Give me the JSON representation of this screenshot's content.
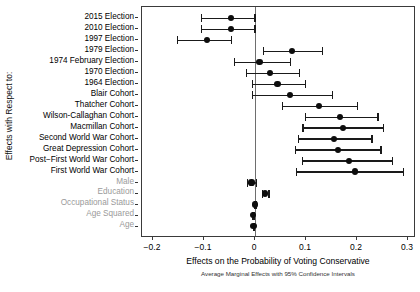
{
  "axis": {
    "y_title": "Effects with Respect to:",
    "x_title": "Effects on the Probability of Voting Conservative",
    "x_subtitle": "Average Marginal Effects with 95% Confidence Intervals"
  },
  "chart_data": {
    "type": "scatter",
    "subtype": "forest-plot",
    "title": "Effects on the Probability of Voting Conservative",
    "subtitle": "Average Marginal Effects with 95% Confidence Intervals",
    "xlabel": "Effects on the Probability of Voting Conservative",
    "ylabel": "Effects with Respect to:",
    "xlim": [
      -0.2,
      0.3
    ],
    "xticks": [
      -0.2,
      -0.1,
      0,
      0.1,
      0.2,
      0.3
    ],
    "xticklabels": [
      "−0.2",
      "−0.1",
      "0",
      "0.1",
      "0.2",
      "0.3"
    ],
    "grid": false,
    "legend": "none",
    "reference_line": 0,
    "categories": [
      "2015 Election",
      "2010 Election",
      "1997 Election",
      "1979 Election",
      "1974 February Election",
      "1970 Election",
      "1964 Election",
      "Blair Cohort",
      "Thatcher Cohort",
      "Wilson-Callaghan Cohort",
      "Macmillan Cohort",
      "Second World War Cohort",
      "Great Depression Cohort",
      "Post−First World War Cohort",
      "First World War Cohort",
      "Male",
      "Education",
      "Occupational Status",
      "Age Squared",
      "Age"
    ],
    "points": [
      {
        "label": "2015 Election",
        "estimate": -0.047,
        "ci_low": -0.106,
        "ci_high": -0.001,
        "muted": false
      },
      {
        "label": "2010 Election",
        "estimate": -0.047,
        "ci_low": -0.106,
        "ci_high": -0.001,
        "muted": false
      },
      {
        "label": "1997 Election",
        "estimate": -0.094,
        "ci_low": -0.153,
        "ci_high": -0.047,
        "muted": false
      },
      {
        "label": "1979 Election",
        "estimate": 0.073,
        "ci_low": 0.016,
        "ci_high": 0.131,
        "muted": false
      },
      {
        "label": "1974 February Election",
        "estimate": 0.009,
        "ci_low": -0.041,
        "ci_high": 0.068,
        "muted": false
      },
      {
        "label": "1970 Election",
        "estimate": 0.03,
        "ci_low": -0.018,
        "ci_high": 0.086,
        "muted": false
      },
      {
        "label": "1964 Election",
        "estimate": 0.044,
        "ci_low": -0.006,
        "ci_high": 0.098,
        "muted": false
      },
      {
        "label": "Blair Cohort",
        "estimate": 0.069,
        "ci_low": -0.006,
        "ci_high": 0.151,
        "muted": false
      },
      {
        "label": "Thatcher Cohort",
        "estimate": 0.125,
        "ci_low": 0.053,
        "ci_high": 0.2,
        "muted": false
      },
      {
        "label": "Wilson-Callaghan Cohort",
        "estimate": 0.167,
        "ci_low": 0.098,
        "ci_high": 0.24,
        "muted": false
      },
      {
        "label": "Macmillan Cohort",
        "estimate": 0.172,
        "ci_low": 0.093,
        "ci_high": 0.251,
        "muted": false
      },
      {
        "label": "Second World War Cohort",
        "estimate": 0.155,
        "ci_low": 0.084,
        "ci_high": 0.228,
        "muted": false
      },
      {
        "label": "Great Depression Cohort",
        "estimate": 0.163,
        "ci_low": 0.078,
        "ci_high": 0.246,
        "muted": false
      },
      {
        "label": "Post−First World War Cohort",
        "estimate": 0.185,
        "ci_low": 0.092,
        "ci_high": 0.268,
        "muted": false
      },
      {
        "label": "First World War Cohort",
        "estimate": 0.196,
        "ci_low": 0.08,
        "ci_high": 0.29,
        "muted": false
      },
      {
        "label": "Male",
        "estimate": -0.007,
        "ci_low": -0.016,
        "ci_high": 0.002,
        "muted": true
      },
      {
        "label": "Education",
        "estimate": 0.019,
        "ci_low": 0.013,
        "ci_high": 0.026,
        "muted": true
      },
      {
        "label": "Occupational Status",
        "estimate": 0.0,
        "ci_low": -0.001,
        "ci_high": 0.001,
        "muted": true
      },
      {
        "label": "Age Squared",
        "estimate": -0.004,
        "ci_low": -0.005,
        "ci_high": -0.003,
        "muted": true
      },
      {
        "label": "Age",
        "estimate": -0.003,
        "ci_low": -0.004,
        "ci_high": -0.002,
        "muted": true
      }
    ]
  }
}
